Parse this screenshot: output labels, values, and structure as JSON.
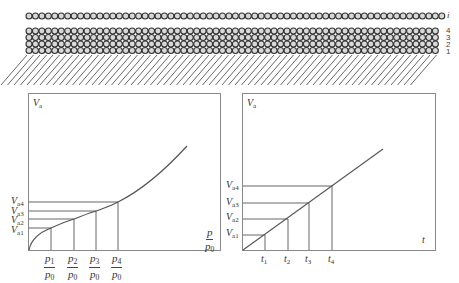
{
  "figure": {
    "adsorption_layers": {
      "top_layer_label": "i",
      "stack_labels": [
        "4",
        "3",
        "2",
        "1"
      ],
      "surface": "hatched solid surface"
    },
    "left_chart": {
      "y_axis_label": "V",
      "y_axis_sub": "a",
      "x_axis_label_num": "p",
      "x_axis_label_den": "p",
      "x_axis_label_den_sub": "0",
      "y_ticks": [
        {
          "main": "V",
          "sub": "a4"
        },
        {
          "main": "V",
          "sub": "a3"
        },
        {
          "main": "V",
          "sub": "a2"
        },
        {
          "main": "V",
          "sub": "a1"
        }
      ],
      "x_ticks": [
        {
          "num": "p",
          "num_sub": "1",
          "den": "p",
          "den_sub": "0"
        },
        {
          "num": "p",
          "num_sub": "2",
          "den": "p",
          "den_sub": "0"
        },
        {
          "num": "p",
          "num_sub": "3",
          "den": "p",
          "den_sub": "0"
        },
        {
          "num": "p",
          "num_sub": "4",
          "den": "p",
          "den_sub": "0"
        }
      ]
    },
    "right_chart": {
      "y_axis_label": "V",
      "y_axis_sub": "a",
      "x_axis_label": "t",
      "y_ticks": [
        {
          "main": "V",
          "sub": "a4"
        },
        {
          "main": "V",
          "sub": "a3"
        },
        {
          "main": "V",
          "sub": "a2"
        },
        {
          "main": "V",
          "sub": "a1"
        }
      ],
      "x_ticks": [
        {
          "main": "t",
          "sub": "1"
        },
        {
          "main": "t",
          "sub": "2"
        },
        {
          "main": "t",
          "sub": "3"
        },
        {
          "main": "t",
          "sub": "4"
        }
      ]
    },
    "colors": {
      "line": "#555555",
      "frame": "#777777",
      "circle_fill": "#d8d8d8",
      "circle_stroke": "#333333"
    }
  }
}
